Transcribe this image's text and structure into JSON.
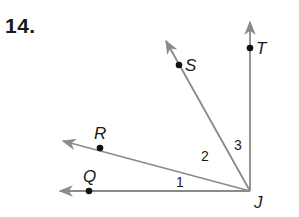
{
  "problem": {
    "number": "14."
  },
  "figure": {
    "ray_color": "#8a8a8a",
    "point_color": "#111111",
    "vertex": {
      "label": "J"
    },
    "rays": [
      {
        "name": "JT",
        "point_label": "T"
      },
      {
        "name": "JS",
        "point_label": "S"
      },
      {
        "name": "JR",
        "point_label": "R"
      },
      {
        "name": "JQ",
        "point_label": "Q"
      }
    ],
    "angles": [
      {
        "label": "1",
        "between": "JQ-JR"
      },
      {
        "label": "2",
        "between": "JR-JS"
      },
      {
        "label": "3",
        "between": "JS-JT"
      }
    ]
  }
}
